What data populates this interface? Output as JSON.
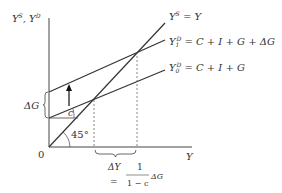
{
  "diagram": {
    "y_axis_label": "Y^S, Y^D",
    "y_axis_label_main": "Y",
    "y_axis_sup1": "S",
    "y_axis_sep": ", Y",
    "y_axis_sup2": "D",
    "x_axis_label": "Y",
    "origin_label": "0",
    "angle_label": "45°",
    "slope_label": "c",
    "delta_g_label": "ΔG",
    "lines": [
      {
        "id": "supply",
        "label_lhs": "Y",
        "label_sup": "S",
        "label_rhs": " = Y"
      },
      {
        "id": "demand1",
        "label_lhs": "Y",
        "label_sub": "1",
        "label_sup": "D",
        "label_rhs": " = C + I + G + ΔG"
      },
      {
        "id": "demand0",
        "label_lhs": "Y",
        "label_sub": "0",
        "label_sup": "D",
        "label_rhs": " = C + I + G"
      }
    ],
    "delta_y_label": "ΔY",
    "equals": "=",
    "fraction_num": "1",
    "fraction_den": "1 − c",
    "fraction_tail": "ΔG"
  }
}
